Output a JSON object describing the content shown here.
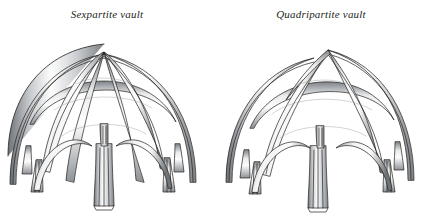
{
  "figure": {
    "background_color": "#ffffff",
    "ink_color": "#231f1c",
    "rib_light": "#fdfdfd",
    "rib_mid": "#b9bcc0",
    "rib_dark": "#6e7378",
    "style": "pen-and-ink architectural line drawing, axonometric view"
  },
  "panels": [
    {
      "id": "sexpartite",
      "caption": "Sexpartite vault",
      "alt": "Line drawing of a Gothic sexpartite rib vault seen from below and the side, with ribs springing from clustered pier shafts and meeting at a central crown",
      "rib_count": 6,
      "cells": 6,
      "bounds": {
        "x": 14,
        "y": 26,
        "width": 191,
        "height": 180
      }
    },
    {
      "id": "quadripartite",
      "caption": "Quadripartite vault",
      "alt": "Line drawing of a Gothic quadripartite rib vault seen from below and the side, with four diagonal ribs meeting at a central boss",
      "rib_count": 4,
      "cells": 4,
      "bounds": {
        "x": 222,
        "y": 26,
        "width": 196,
        "height": 180
      }
    }
  ]
}
